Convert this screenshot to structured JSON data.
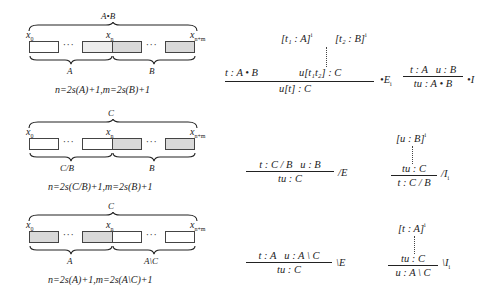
{
  "panels": [
    {
      "top_label": "A•B",
      "x_left": "x",
      "x_left_sub": "0",
      "x_mid": "x",
      "x_mid_sub": "n",
      "x_right": "x",
      "x_right_sub": "n+m",
      "left_label": "A",
      "right_label": "B",
      "formula": "n=2s(A)+1,m=2s(B)+1",
      "shading": [
        "white",
        "light-gray",
        "light-gray",
        "light-gray"
      ]
    },
    {
      "top_label": "C",
      "x_left": "x",
      "x_left_sub": "0",
      "x_mid": "x",
      "x_mid_sub": "n",
      "x_right": "x",
      "x_right_sub": "n+m",
      "left_label": "C/B",
      "right_label": "B",
      "formula": "n=2s(C/B)+1,m=2s(B)+1",
      "shading": [
        "white",
        "white",
        "light-gray",
        "light-gray"
      ]
    },
    {
      "top_label": "C",
      "x_left": "x",
      "x_left_sub": "0",
      "x_mid": "x",
      "x_mid_sub": "n",
      "x_right": "x",
      "x_right_sub": "n+m",
      "left_label": "A",
      "right_label": "A\\C",
      "formula": "n=2s(A)+1,m=2s(A\\C)+1",
      "shading": [
        "light-gray",
        "light-gray",
        "white",
        "white"
      ]
    }
  ],
  "rules": {
    "prod_elim": {
      "hyp1": "[t₁ : A]",
      "hyp1_sup": "i",
      "hyp2": "[t₂ : B]",
      "hyp2_sup": "i",
      "premise_left": "t : A • B",
      "premise_right": "u[t₁t₂] : C",
      "conclusion": "u[t] : C",
      "name": "•E",
      "name_sub": "i"
    },
    "prod_intro": {
      "premise_left": "t : A",
      "premise_right": "u : B",
      "conclusion": "tu : A • B",
      "name": "•I"
    },
    "slash_elim": {
      "premise_left": "t : C / B",
      "premise_right": "u : B",
      "conclusion": "tu : C",
      "name": "/E"
    },
    "slash_intro": {
      "hyp": "[u : B]",
      "hyp_sup": "i",
      "premise": "tu : C",
      "conclusion": "t : C / B",
      "name": "/I",
      "name_sub": "i"
    },
    "backslash_elim": {
      "premise_left": "t : A",
      "premise_right": "u : A \\ C",
      "conclusion": "tu : C",
      "name": "\\E"
    },
    "backslash_intro": {
      "hyp": "[t : A]",
      "hyp_sup": "i",
      "premise": "tu : C",
      "conclusion": "u : A \\ C",
      "name": "\\I",
      "name_sub": "i"
    }
  }
}
